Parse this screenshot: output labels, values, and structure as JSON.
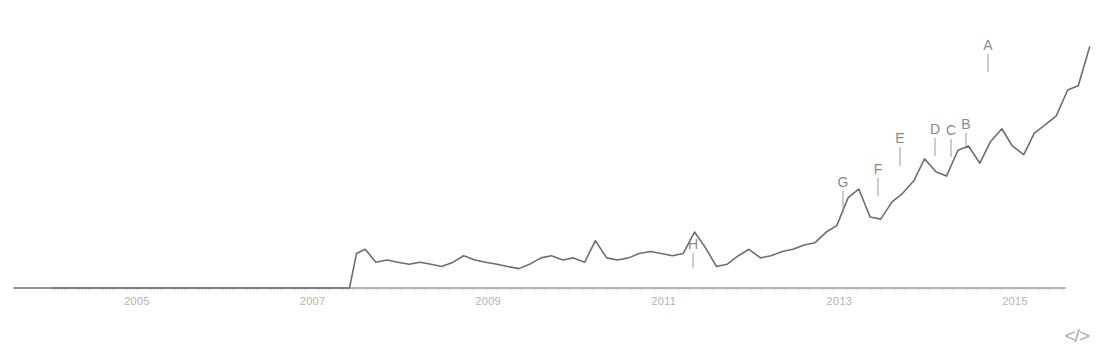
{
  "chart_data": {
    "type": "line",
    "title": "",
    "subtitle": "",
    "xlabel": "",
    "ylabel": "",
    "grid": false,
    "legend_position": "none",
    "xlim": [
      2003.6,
      2015.95
    ],
    "ylim": [
      0,
      100
    ],
    "x_tick_labels": [
      "2005",
      "2007",
      "2009",
      "2011",
      "2013",
      "2015"
    ],
    "x_tick_values": [
      2005,
      2007,
      2009,
      2011,
      2013,
      2015
    ],
    "series": [
      {
        "name": "value",
        "x": [
          2003.6,
          2003.85,
          2004.1,
          2004.35,
          2004.6,
          2004.85,
          2005.1,
          2005.35,
          2005.6,
          2005.85,
          2006.1,
          2006.35,
          2006.6,
          2006.85,
          2007.1,
          2007.35,
          2007.42,
          2007.5,
          2007.6,
          2007.72,
          2007.85,
          2007.97,
          2008.1,
          2008.22,
          2008.35,
          2008.47,
          2008.6,
          2008.72,
          2008.85,
          2008.97,
          2009.1,
          2009.22,
          2009.35,
          2009.47,
          2009.6,
          2009.72,
          2009.85,
          2009.97,
          2010.1,
          2010.22,
          2010.35,
          2010.47,
          2010.6,
          2010.72,
          2010.85,
          2010.97,
          2011.1,
          2011.22,
          2011.35,
          2011.47,
          2011.6,
          2011.72,
          2011.85,
          2011.97,
          2012.1,
          2012.22,
          2012.35,
          2012.47,
          2012.6,
          2012.72,
          2012.85,
          2012.97,
          2013.1,
          2013.22,
          2013.35,
          2013.47,
          2013.6,
          2013.72,
          2013.85,
          2013.97,
          2014.1,
          2014.22,
          2014.35,
          2014.47,
          2014.6,
          2014.72,
          2014.85,
          2014.97,
          2015.1,
          2015.22,
          2015.35,
          2015.47,
          2015.6,
          2015.72,
          2015.85
        ],
        "y": [
          0,
          0,
          0,
          0,
          0,
          0,
          0,
          0,
          0,
          0,
          0,
          0,
          0,
          0,
          0,
          0,
          0,
          8,
          9,
          6,
          6.5,
          6,
          5.5,
          6,
          5.5,
          5,
          6,
          7.5,
          6.5,
          6,
          5.5,
          5,
          4.5,
          5.5,
          7,
          7.5,
          6.5,
          7,
          6,
          11,
          7,
          6.5,
          7,
          8,
          8.5,
          8,
          7.5,
          8,
          13,
          9.5,
          5,
          5.5,
          7.5,
          9,
          7,
          7.5,
          8.5,
          9,
          10,
          10.5,
          13,
          14.5,
          21,
          23,
          16.5,
          16,
          20,
          22,
          25,
          30,
          27,
          26,
          32,
          33,
          29,
          34,
          37,
          33,
          31,
          36,
          38,
          40,
          46,
          47,
          56
        ],
        "color": "#6e6e6e"
      }
    ],
    "annotations": [
      {
        "label": "A",
        "x": 2014.6,
        "label_px_x": 988,
        "label_px_y": 50,
        "point_px_x": 988,
        "point_px_y": 72,
        "leader": true
      },
      {
        "label": "B",
        "x": 2014.2,
        "label_px_x": 966,
        "label_px_y": 129,
        "point_px_x": 966,
        "point_px_y": 146,
        "leader": true
      },
      {
        "label": "C",
        "x": 2013.85,
        "label_px_x": 951,
        "label_px_y": 135,
        "point_px_x": 951,
        "point_px_y": 157,
        "leader": true
      },
      {
        "label": "D",
        "x": 2013.6,
        "label_px_x": 935,
        "label_px_y": 134,
        "point_px_x": 935,
        "point_px_y": 156,
        "leader": true
      },
      {
        "label": "E",
        "x": 2013.1,
        "label_px_x": 900,
        "label_px_y": 143,
        "point_px_x": 900,
        "point_px_y": 166,
        "leader": true
      },
      {
        "label": "F",
        "x": 2012.72,
        "label_px_x": 878,
        "label_px_y": 174,
        "point_px_x": 878,
        "point_px_y": 196,
        "leader": true
      },
      {
        "label": "G",
        "x": 2012.35,
        "label_px_x": 843,
        "label_px_y": 187,
        "point_px_x": 843,
        "point_px_y": 213,
        "leader": true
      },
      {
        "label": "H",
        "x": 2011.35,
        "label_px_x": 693,
        "label_px_y": 249,
        "point_px_x": 693,
        "point_px_y": 268,
        "leader": true
      }
    ]
  },
  "footer": {
    "code_icon_label": "</>",
    "code_icon_name": "code-embed-icon"
  }
}
